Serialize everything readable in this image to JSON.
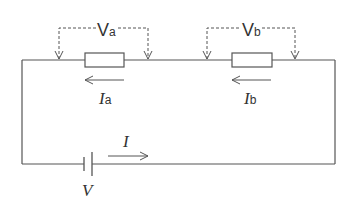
{
  "diagram": {
    "type": "series circuit",
    "colors": {
      "wire": "#555555",
      "text": "#333333",
      "background": "#ffffff"
    },
    "components": [
      {
        "id": "resistor-a",
        "kind": "resistor",
        "voltage_label": "V",
        "voltage_sub": "a",
        "current_label": "I",
        "current_sub": "a",
        "current_direction": "left"
      },
      {
        "id": "resistor-b",
        "kind": "resistor",
        "voltage_label": "V",
        "voltage_sub": "b",
        "current_label": "I",
        "current_sub": "b",
        "current_direction": "left"
      },
      {
        "id": "battery",
        "kind": "cell",
        "label": "V"
      }
    ],
    "main_current": {
      "label": "I",
      "direction": "right"
    }
  }
}
